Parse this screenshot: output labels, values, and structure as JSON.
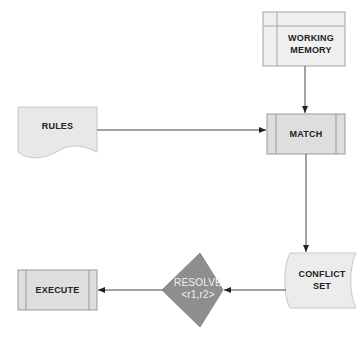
{
  "diagram": {
    "nodes": {
      "working_memory": {
        "label_line1": "WORKING",
        "label_line2": "MEMORY",
        "shape": "internal-storage"
      },
      "rules": {
        "label": "RULES",
        "shape": "document"
      },
      "match": {
        "label": "MATCH",
        "shape": "predefined-process"
      },
      "conflict_set": {
        "label_line1": "CONFLICT",
        "label_line2": "SET",
        "shape": "stored-data"
      },
      "resolve": {
        "label_line1": "RESOLVE",
        "label_line2": "<r1,r2>",
        "shape": "decision"
      },
      "execute": {
        "label": "EXECUTE",
        "shape": "predefined-process"
      }
    },
    "edges": [
      {
        "from": "working_memory",
        "to": "match"
      },
      {
        "from": "rules",
        "to": "match"
      },
      {
        "from": "match",
        "to": "conflict_set"
      },
      {
        "from": "conflict_set",
        "to": "resolve"
      },
      {
        "from": "resolve",
        "to": "execute"
      }
    ],
    "colors": {
      "box_fill": "#e4e4e4",
      "box_fill_light": "#efefef",
      "box_stroke": "#9a9a9a",
      "diamond_fill": "#8e8e8e",
      "diamond_text": "#f2f2f2",
      "edge": "#444444"
    }
  }
}
